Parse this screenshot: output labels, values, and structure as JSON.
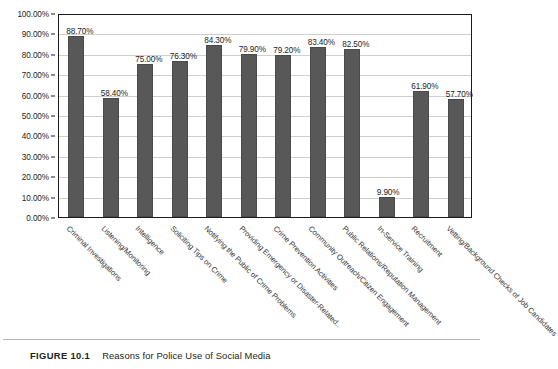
{
  "caption": {
    "figure_label": "FIGURE 10.1",
    "title": "Reasons for Police Use of Social Media"
  },
  "chart_data": {
    "type": "bar",
    "title": "Reasons for Police Use of Social Media",
    "xlabel": "",
    "ylabel": "",
    "ylim": [
      0,
      100
    ],
    "grid": true,
    "legend": "none",
    "value_suffix": "%",
    "bar_color": "#585858",
    "categories": [
      "Criminal Investigations",
      "Listening/Monitoring",
      "Intelligence",
      "Soliciting Tips on Crime",
      "Notifying the Public of Crime Problems",
      "Providing Emergency or Disaster-Related..",
      "Crime Prevention Activities",
      "Community Outreach/Citizen Engagement",
      "Public Relations/Reputation Management",
      "In-Service Training",
      "Recruitment",
      "Vetting/Background Checks of Job Candidates"
    ],
    "values": [
      88.7,
      58.4,
      75.0,
      76.3,
      84.3,
      79.9,
      79.2,
      83.4,
      82.5,
      9.9,
      61.9,
      57.7
    ],
    "value_labels": [
      "88.70%",
      "58.40%",
      "75.00%",
      "76.30%",
      "84.30%",
      "79.90%",
      "79.20%",
      "83.40%",
      "82.50%",
      "9.90%",
      "61.90%",
      "57.70%"
    ],
    "yticks": [
      0,
      10,
      20,
      30,
      40,
      50,
      60,
      70,
      80,
      90,
      100
    ],
    "ytick_labels": [
      "0.00%",
      "10.00%",
      "20.00%",
      "30.00%",
      "40.00%",
      "50.00%",
      "60.00%",
      "70.00%",
      "80.00%",
      "90.00%",
      "100.00%"
    ]
  }
}
